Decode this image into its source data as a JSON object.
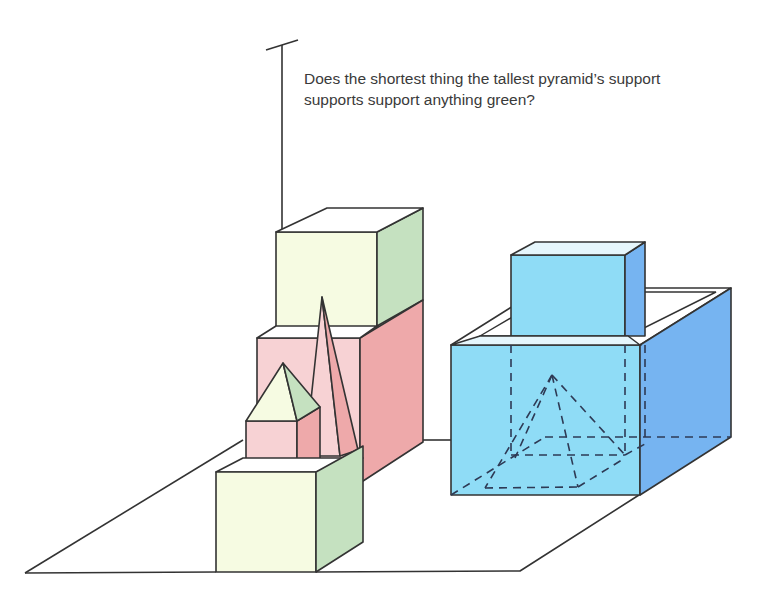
{
  "question": {
    "line1": "Does the shortest thing the tallest pyramid’s support",
    "line2": "supports support anything green?"
  },
  "colors": {
    "green_front": "#f6fbe2",
    "green_side": "#c5e1c0",
    "pink_front": "#f7d2d4",
    "pink_side": "#eea9aa",
    "blue_front": "#8fdcf6",
    "blue_side": "#76b4f1",
    "blue_top": "#e6f6fc",
    "line": "#333333"
  },
  "objects": [
    {
      "id": "floor-plane",
      "kind": "plane"
    },
    {
      "id": "tall-green-box",
      "kind": "box",
      "color": "green"
    },
    {
      "id": "pink-box",
      "kind": "box",
      "color": "pink"
    },
    {
      "id": "tall-pink-pyramid",
      "kind": "pyramid",
      "color": "pink"
    },
    {
      "id": "small-pink-cube",
      "kind": "box",
      "color": "pink"
    },
    {
      "id": "green-pyramid",
      "kind": "pyramid",
      "color": "green"
    },
    {
      "id": "green-cube",
      "kind": "box",
      "color": "green"
    },
    {
      "id": "blue-container",
      "kind": "open-box",
      "color": "blue"
    },
    {
      "id": "blue-cube",
      "kind": "box",
      "color": "blue"
    },
    {
      "id": "hidden-pyramid",
      "kind": "pyramid",
      "hidden": true
    }
  ]
}
